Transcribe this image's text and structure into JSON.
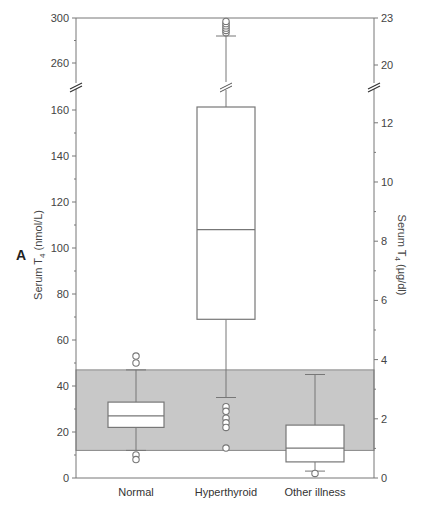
{
  "chart_data": {
    "type": "box",
    "panel_label": "A",
    "title": "",
    "xlabel": "",
    "ylabel": "Serum T4 (nmol/L)",
    "ylabel_right": "Serum T4 (µg/dl)",
    "categories": [
      "Normal",
      "Hyperthyroid",
      "Other illness"
    ],
    "y_axis_left": {
      "segments": [
        {
          "range": [
            0,
            160
          ],
          "ticks": [
            0,
            20,
            40,
            60,
            80,
            100,
            120,
            140,
            160
          ]
        },
        {
          "range": [
            250,
            300
          ],
          "ticks": [
            260,
            300
          ]
        }
      ],
      "break": true
    },
    "y_axis_right": {
      "ticks": [
        0,
        2,
        4,
        6,
        8,
        10,
        12,
        20,
        23
      ],
      "break": true
    },
    "reference_range": {
      "low": 12,
      "high": 47,
      "color": "#c8c8c8",
      "label": "normal reference range"
    },
    "series": [
      {
        "name": "Normal",
        "whisker_low": 12,
        "q1": 22,
        "median": 27,
        "q3": 33,
        "whisker_high": 47,
        "outliers": [
          53,
          50,
          10,
          8
        ]
      },
      {
        "name": "Hyperthyroid",
        "whisker_low": 35,
        "q1": 69,
        "median": 108,
        "q3": 161,
        "whisker_high": 284,
        "outliers": [
          31,
          29,
          26,
          24,
          22,
          13,
          287,
          289,
          291,
          293,
          295,
          297
        ]
      },
      {
        "name": "Other illness",
        "whisker_low": 3,
        "q1": 7,
        "median": 13,
        "q3": 23,
        "whisker_high": 45,
        "outliers": [
          2
        ]
      }
    ],
    "grid": false,
    "legend": null
  }
}
